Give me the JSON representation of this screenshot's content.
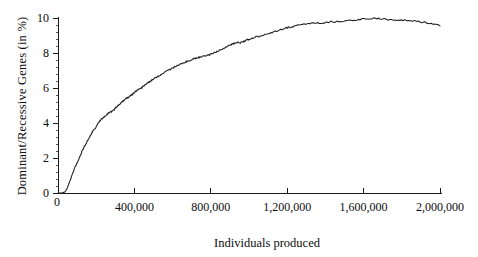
{
  "chart_data": {
    "type": "line",
    "title": "",
    "subtitle": "",
    "xlabel": "Individuals produced",
    "ylabel": "Dominant/Recessive  Genes (in %)",
    "xlim": [
      0,
      2000000
    ],
    "ylim": [
      0,
      10
    ],
    "grid": false,
    "legend": null,
    "x_ticks": [
      0,
      400000,
      800000,
      1200000,
      1600000,
      2000000
    ],
    "x_tick_labels": [
      "0",
      "400,000",
      "800,000",
      "1,200,000",
      "1,600,000",
      "2,000,000"
    ],
    "y_ticks": [
      0,
      2,
      4,
      6,
      8,
      10
    ],
    "y_tick_labels": [
      "0",
      "2",
      "4",
      "6",
      "8",
      "10"
    ],
    "y_minor_tick_step": 0.4,
    "series": [
      {
        "name": "Dominant/Recessive Genes",
        "color": "#1c1c1c",
        "x": [
          0,
          20000,
          35000,
          45000,
          55000,
          65000,
          75000,
          85000,
          95000,
          105000,
          115000,
          125000,
          135000,
          145000,
          155000,
          165000,
          175000,
          185000,
          195000,
          205000,
          215000,
          225000,
          235000,
          245000,
          255000,
          265000,
          275000,
          285000,
          295000,
          305000,
          315000,
          325000,
          335000,
          345000,
          355000,
          365000,
          375000,
          385000,
          395000,
          405000,
          415000,
          425000,
          435000,
          445000,
          455000,
          465000,
          475000,
          485000,
          495000,
          505000,
          520000,
          535000,
          550000,
          565000,
          580000,
          595000,
          610000,
          625000,
          640000,
          655000,
          670000,
          685000,
          700000,
          715000,
          730000,
          745000,
          760000,
          775000,
          790000,
          805000,
          820000,
          835000,
          850000,
          865000,
          880000,
          895000,
          910000,
          925000,
          940000,
          955000,
          970000,
          985000,
          1000000,
          1020000,
          1040000,
          1060000,
          1080000,
          1100000,
          1120000,
          1140000,
          1160000,
          1180000,
          1200000,
          1225000,
          1250000,
          1275000,
          1300000,
          1325000,
          1350000,
          1375000,
          1400000,
          1430000,
          1460000,
          1490000,
          1520000,
          1550000,
          1580000,
          1610000,
          1640000,
          1670000,
          1700000,
          1730000,
          1760000,
          1790000,
          1820000,
          1850000,
          1880000,
          1910000,
          1940000,
          1970000,
          2000000
        ],
        "y": [
          0.0,
          0.0,
          0.05,
          0.2,
          0.45,
          0.75,
          1.05,
          1.35,
          1.6,
          1.85,
          2.1,
          2.35,
          2.6,
          2.8,
          3.0,
          3.2,
          3.4,
          3.55,
          3.7,
          3.9,
          4.05,
          4.2,
          4.3,
          4.4,
          4.5,
          4.58,
          4.62,
          4.68,
          4.78,
          4.9,
          5.0,
          5.1,
          5.2,
          5.28,
          5.38,
          5.45,
          5.52,
          5.6,
          5.68,
          5.78,
          5.88,
          5.95,
          6.0,
          6.08,
          6.18,
          6.25,
          6.32,
          6.4,
          6.48,
          6.55,
          6.65,
          6.75,
          6.85,
          6.95,
          7.02,
          7.1,
          7.2,
          7.28,
          7.35,
          7.42,
          7.5,
          7.55,
          7.62,
          7.68,
          7.72,
          7.78,
          7.82,
          7.85,
          7.88,
          7.95,
          8.02,
          8.1,
          8.18,
          8.25,
          8.35,
          8.42,
          8.5,
          8.55,
          8.62,
          8.58,
          8.65,
          8.72,
          8.78,
          8.85,
          8.92,
          8.98,
          9.05,
          9.12,
          9.18,
          9.25,
          9.3,
          9.38,
          9.45,
          9.5,
          9.56,
          9.6,
          9.65,
          9.68,
          9.7,
          9.72,
          9.75,
          9.78,
          9.8,
          9.82,
          9.85,
          9.88,
          9.92,
          9.95,
          9.98,
          9.96,
          9.94,
          9.9,
          9.88,
          9.86,
          9.88,
          9.85,
          9.8,
          9.75,
          9.7,
          9.62,
          9.55
        ]
      }
    ]
  }
}
